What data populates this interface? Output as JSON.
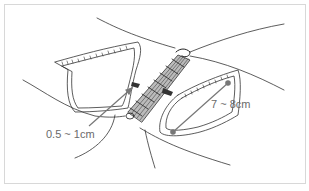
{
  "figure": {
    "type": "surgical illustration",
    "labels": {
      "gap_distance": "0.5 ~ 1cm",
      "length": "7 ~ 8cm"
    },
    "colors": {
      "line": "#333333",
      "shading": "#555555",
      "arrow": "#777777",
      "label": "#6a6a6a",
      "frame": "#d8d8d8"
    }
  }
}
